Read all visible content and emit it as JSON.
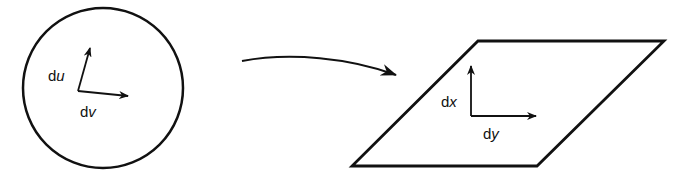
{
  "diagram": {
    "source_shape": "circle",
    "target_shape": "parallelogram",
    "mapping_arrow": "curved-arrow",
    "source_labels": {
      "du": {
        "prefix": "d",
        "var": "u"
      },
      "dv": {
        "prefix": "d",
        "var": "v"
      }
    },
    "target_labels": {
      "dx": {
        "prefix": "d",
        "var": "x"
      },
      "dy": {
        "prefix": "d",
        "var": "y"
      }
    },
    "colors": {
      "stroke": "#111111",
      "background": "#ffffff"
    }
  }
}
